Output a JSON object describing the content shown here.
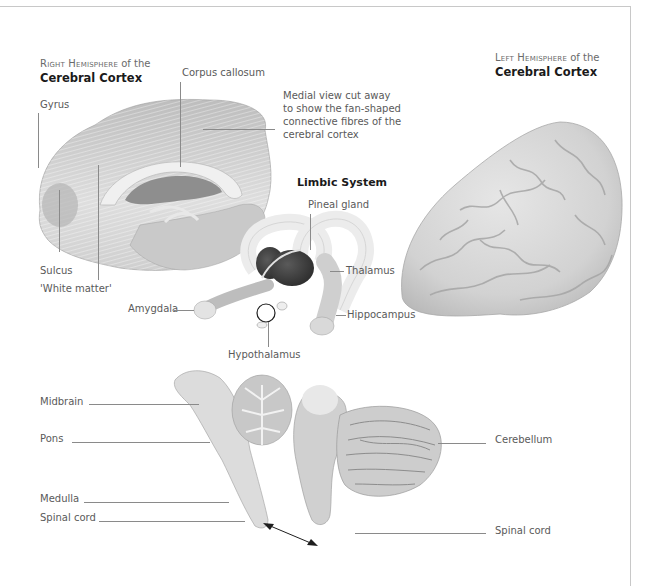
{
  "figure": {
    "right_hemisphere": {
      "title_prefix": "Right Hemisphere",
      "title_suffix": " of the",
      "title_bold": "Cerebral Cortex",
      "labels": {
        "gyrus": "Gyrus",
        "corpus_callosum": "Corpus callosum",
        "sulcus": "Sulcus",
        "white_matter": "'White matter'"
      },
      "caption_lines": [
        "Medial view cut away",
        "to show the fan-shaped",
        "connective fibres of the",
        "cerebral cortex"
      ]
    },
    "left_hemisphere": {
      "title_prefix": "Left Hemisphere",
      "title_suffix": " of the",
      "title_bold": "Cerebral Cortex"
    },
    "limbic_system": {
      "title": "Limbic System",
      "labels": {
        "pineal_gland": "Pineal gland",
        "thalamus": "Thalamus",
        "amygdala": "Amygdala",
        "hippocampus": "Hippocampus",
        "hypothalamus": "Hypothalamus"
      }
    },
    "brainstem": {
      "labels": {
        "midbrain": "Midbrain",
        "pons": "Pons",
        "medulla": "Medulla",
        "spinal_cord_left": "Spinal cord",
        "cerebellum": "Cerebellum",
        "spinal_cord_right": "Spinal cord"
      }
    },
    "colors": {
      "frame": "#c8c8c8",
      "leader_line": "#8a8a8a",
      "label_text": "#5a5a5a",
      "title_text": "#1a1a1a",
      "tissue_light": "#e4e4e4",
      "tissue_mid": "#c4c4c4",
      "thalamus_dark": "#3c3c3c"
    }
  }
}
